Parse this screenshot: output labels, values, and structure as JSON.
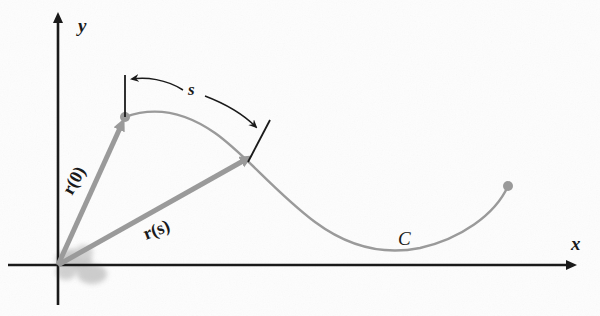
{
  "figure": {
    "background_color": "#fdfdfd",
    "axis_color": "#1a1a1a",
    "curve_color": "#9a9a9a",
    "vector_color": "#9a9a9a",
    "annotation_color": "#1a1a1a",
    "width": 600,
    "height": 316
  },
  "axes": {
    "origin": {
      "x": 58,
      "y": 265
    },
    "x_axis": {
      "label": "x",
      "label_x": 571,
      "label_y": 250,
      "start_x": 8,
      "end_x": 578,
      "y": 265
    },
    "y_axis": {
      "label": "y",
      "label_x": 78,
      "label_y": 32,
      "x": 58,
      "start_y": 305,
      "end_y": 16
    }
  },
  "curve": {
    "name": "C",
    "label": "C",
    "label_x": 398,
    "label_y": 245,
    "start_point": {
      "x": 125,
      "y": 117
    },
    "end_point": {
      "x": 508,
      "y": 186
    },
    "path": "M 125 117 C 155 106, 185 112, 215 133 C 245 154, 275 192, 315 222 C 350 248, 385 255, 420 248 C 460 239, 495 215, 508 186",
    "stroke_width": 2.4
  },
  "vectors": [
    {
      "name": "r(0)",
      "label": "r(0)",
      "label_x": 72,
      "label_y": 196,
      "label_rotation": -61,
      "from": {
        "x": 58,
        "y": 265
      },
      "to": {
        "x": 125,
        "y": 117
      },
      "stroke_width": 5
    },
    {
      "name": "r(s)",
      "label": "r(s)",
      "label_x": 146,
      "label_y": 240,
      "label_rotation": -21,
      "from": {
        "x": 58,
        "y": 265
      },
      "to": {
        "x": 252,
        "y": 156
      },
      "stroke_width": 5
    }
  ],
  "arc_measure": {
    "label": "s",
    "label_x": 188,
    "label_y": 95,
    "start_tick": {
      "x1": 125,
      "y1": 75,
      "x2": 125,
      "y2": 117
    },
    "end_tick": {
      "x1": 270,
      "y1": 120,
      "x2": 248,
      "y2": 162
    },
    "left_arrow_path": "M 183 90 C 166 79, 146 77, 130 79",
    "right_arrow_path": "M 205 96 C 226 104, 244 115, 258 129"
  },
  "endpoints": [
    {
      "name": "curve-start-dot",
      "x": 125,
      "y": 117,
      "r": 5
    },
    {
      "name": "curve-end-dot",
      "x": 508,
      "y": 186,
      "r": 5
    }
  ],
  "artifacts": {
    "origin_smudge": {
      "name": "pencil-smudge",
      "x": 60,
      "y": 248,
      "width": 62,
      "height": 46
    }
  }
}
